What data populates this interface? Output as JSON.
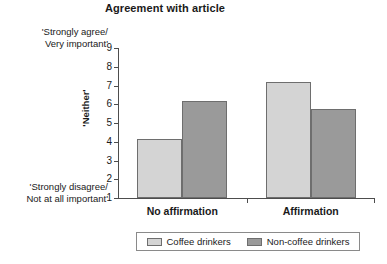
{
  "chart_data": {
    "type": "bar",
    "title": "Agreement with article",
    "xlabel": "",
    "ylabel": "'Neither'",
    "categories": [
      "No affirmation",
      "Affirmation"
    ],
    "series": [
      {
        "name": "Coffee drinkers",
        "values": [
          4.15,
          7.2
        ],
        "color": "#d4d4d4"
      },
      {
        "name": "Non-coffee drinkers",
        "values": [
          6.2,
          5.75
        ],
        "color": "#9a9a9a"
      }
    ],
    "ylim": [
      1,
      9
    ],
    "yticks": [
      1,
      2,
      3,
      4,
      5,
      6,
      7,
      8,
      9
    ],
    "ytick_labels": [
      "1",
      "2",
      "3",
      "4",
      "5",
      "6",
      "7",
      "8",
      "9"
    ],
    "grid": false,
    "legend_position": "bottom",
    "axis_anchor_high": "'Strongly agree/\nVery important'",
    "axis_anchor_low": "'Strongly disagree/\nNot at all important'",
    "anchor_high_line1": "'Strongly agree/",
    "anchor_high_line2": "Very important'",
    "anchor_low_line1": "'Strongly disagree/",
    "anchor_low_line2": "Not at all important'"
  }
}
